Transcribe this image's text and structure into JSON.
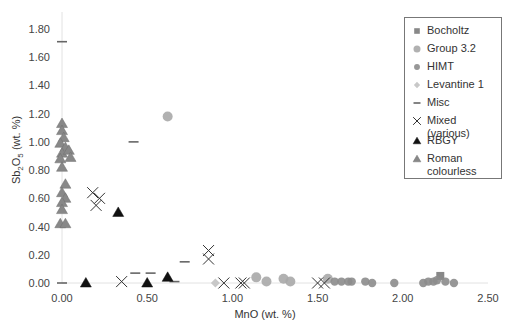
{
  "chart_data": {
    "type": "scatter",
    "title": "",
    "xlabel": "MnO (wt. %)",
    "ylabel": "Sb2O5 (wt. %)",
    "xlim": [
      0,
      2.5
    ],
    "ylim": [
      0,
      1.8
    ],
    "x_ticks": [
      "0.00",
      "0.50",
      "1.00",
      "1.50",
      "2.00",
      "2.50"
    ],
    "y_ticks": [
      "0.00",
      "0.20",
      "0.40",
      "0.60",
      "0.80",
      "1.00",
      "1.20",
      "1.40",
      "1.60",
      "1.80"
    ],
    "grid": false,
    "legend_position": "upper right",
    "series": [
      {
        "name": "Bocholtz",
        "marker": "square",
        "color": "#888888",
        "points": [
          [
            2.22,
            0.05
          ]
        ]
      },
      {
        "name": "Group 3.2",
        "marker": "circle-large",
        "color": "#a8a8a8",
        "points": [
          [
            0.62,
            1.18
          ],
          [
            1.14,
            0.04
          ],
          [
            1.2,
            0.01
          ],
          [
            1.3,
            0.03
          ],
          [
            1.34,
            0.01
          ],
          [
            1.56,
            0.03
          ]
        ]
      },
      {
        "name": "HIMT",
        "marker": "circle",
        "color": "#8c8c8c",
        "points": [
          [
            1.6,
            0.01
          ],
          [
            1.64,
            0.01
          ],
          [
            1.68,
            0.01
          ],
          [
            1.7,
            0.01
          ],
          [
            1.78,
            0.01
          ],
          [
            1.82,
            0.0
          ],
          [
            1.95,
            0.0
          ],
          [
            2.12,
            0.0
          ],
          [
            2.15,
            0.01
          ],
          [
            2.18,
            0.01
          ],
          [
            2.2,
            0.02
          ],
          [
            2.25,
            0.01
          ],
          [
            2.3,
            0.0
          ]
        ]
      },
      {
        "name": "Levantine 1",
        "marker": "diamond",
        "color": "#c8c8c8",
        "points": [
          [
            0.9,
            0.0
          ]
        ]
      },
      {
        "name": "Misc",
        "marker": "dash",
        "color": "#666666",
        "points": [
          [
            0.0,
            1.71
          ],
          [
            0.42,
            1.0
          ],
          [
            0.43,
            0.07
          ],
          [
            0.52,
            0.07
          ],
          [
            0.72,
            0.15
          ],
          [
            0.66,
            0.01
          ],
          [
            0.0,
            0.0
          ]
        ]
      },
      {
        "name": "Mixed (various)",
        "marker": "x",
        "color": "#333333",
        "points": [
          [
            0.18,
            0.64
          ],
          [
            0.22,
            0.6
          ],
          [
            0.2,
            0.55
          ],
          [
            0.35,
            0.01
          ],
          [
            0.86,
            0.23
          ],
          [
            0.86,
            0.17
          ],
          [
            0.95,
            0.0
          ],
          [
            1.05,
            0.0
          ],
          [
            1.07,
            0.0
          ],
          [
            1.5,
            0.0
          ],
          [
            1.54,
            0.0
          ]
        ]
      },
      {
        "name": "RBGY",
        "marker": "triangle",
        "color": "#111111",
        "points": [
          [
            0.33,
            0.5
          ],
          [
            0.14,
            0.0
          ],
          [
            0.5,
            0.0
          ],
          [
            0.62,
            0.04
          ]
        ]
      },
      {
        "name": "Roman colourless",
        "marker": "triangle",
        "color": "#888888",
        "points": [
          [
            0.0,
            1.13
          ],
          [
            0.0,
            1.08
          ],
          [
            0.01,
            1.03
          ],
          [
            -0.01,
            0.99
          ],
          [
            0.02,
            0.96
          ],
          [
            0.0,
            0.92
          ],
          [
            0.04,
            0.94
          ],
          [
            0.05,
            0.89
          ],
          [
            -0.01,
            0.88
          ],
          [
            0.0,
            0.82
          ],
          [
            0.02,
            0.7
          ],
          [
            0.0,
            0.64
          ],
          [
            0.02,
            0.6
          ],
          [
            0.0,
            0.57
          ],
          [
            0.0,
            0.52
          ],
          [
            -0.01,
            0.42
          ],
          [
            0.02,
            0.42
          ]
        ]
      }
    ]
  },
  "legend": {
    "items": [
      {
        "label": "Bocholtz"
      },
      {
        "label": "Group 3.2"
      },
      {
        "label": "HIMT"
      },
      {
        "label": "Levantine 1"
      },
      {
        "label": "Misc"
      },
      {
        "label": "Mixed (various)"
      },
      {
        "label": "RBGY"
      },
      {
        "label": "Roman colourless"
      }
    ]
  }
}
